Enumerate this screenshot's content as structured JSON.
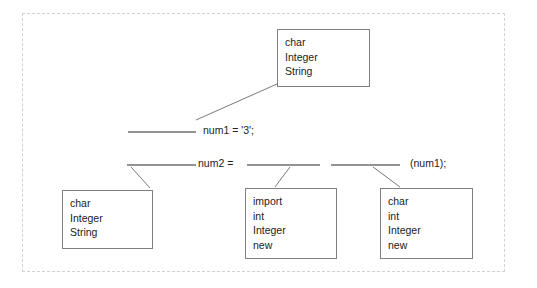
{
  "diagram": {
    "frame": {
      "border_color": "#d2d2d2",
      "style": "dashed"
    },
    "box_border_color": "#808080",
    "text_color": "#222222",
    "background_color": "#ffffff"
  },
  "boxes": [
    {
      "id": "top-word-box",
      "name": "word-box-top",
      "words": [
        "char",
        "Integer",
        "String"
      ],
      "x": 277,
      "y": 29,
      "w": 93,
      "h": 58
    },
    {
      "id": "bottom-left-word-box",
      "name": "word-box-bottom-left",
      "words": [
        "char",
        "Integer",
        "String"
      ],
      "x": 62,
      "y": 190,
      "w": 91,
      "h": 59
    },
    {
      "id": "bottom-middle-word-box",
      "name": "word-box-bottom-middle",
      "words": [
        "import",
        "int",
        "Integer",
        "new"
      ],
      "x": 245,
      "y": 188,
      "w": 92,
      "h": 71
    },
    {
      "id": "bottom-right-word-box",
      "name": "word-box-bottom-right",
      "words": [
        "char",
        "int",
        "Integer",
        "new"
      ],
      "x": 380,
      "y": 188,
      "w": 93,
      "h": 71
    }
  ],
  "code_lines": [
    {
      "id": "line-1",
      "segments": [
        {
          "type": "blank",
          "x": 128,
          "y": 132,
          "w": 68
        },
        {
          "type": "text",
          "value": "num1 = '3';",
          "x": 203,
          "y": 124
        }
      ]
    },
    {
      "id": "line-2",
      "segments": [
        {
          "type": "blank",
          "x": 127,
          "y": 165,
          "w": 69
        },
        {
          "type": "text",
          "value": "num2 =",
          "x": 198,
          "y": 157
        },
        {
          "type": "blank",
          "x": 247,
          "y": 165,
          "w": 73
        },
        {
          "type": "blank",
          "x": 331,
          "y": 165,
          "w": 69
        },
        {
          "type": "text",
          "value": "(num1);",
          "x": 410,
          "y": 157
        }
      ]
    }
  ],
  "connectors": [
    {
      "id": "c1",
      "name": "connector-top-box",
      "x1": 196,
      "y1": 120,
      "x2": 277,
      "y2": 84
    },
    {
      "id": "c2",
      "name": "connector-bottom-left-box",
      "x1": 131,
      "y1": 167,
      "x2": 150,
      "y2": 188
    },
    {
      "id": "c3",
      "name": "connector-bottom-middle-box",
      "x1": 290,
      "y1": 167,
      "x2": 275,
      "y2": 187
    },
    {
      "id": "c4",
      "name": "connector-bottom-right-box",
      "x1": 373,
      "y1": 167,
      "x2": 400,
      "y2": 187
    }
  ],
  "line_color": "#7a7a7a",
  "blank_color": "#6f6f6f"
}
